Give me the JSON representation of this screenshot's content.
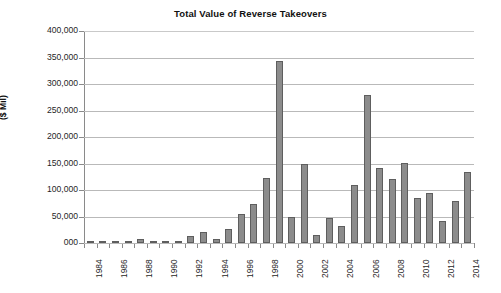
{
  "chart_data": {
    "type": "bar",
    "title": "Total Value of Reverse Takeovers",
    "xlabel": "",
    "ylabel": "($ Mil)",
    "ylim": [
      0,
      400000
    ],
    "ytick_values": [
      0,
      50000,
      100000,
      150000,
      200000,
      250000,
      300000,
      350000,
      400000
    ],
    "ytick_labels": [
      "000",
      "50,000",
      "100,000",
      "150,000",
      "200,000",
      "250,000",
      "300,000",
      "350,000",
      "400,000"
    ],
    "grid": "horizontal",
    "legend": "none",
    "bar_color": "#8c8c8c",
    "bar_border_color": "#5e5e5e",
    "categories": [
      "1984",
      "1985",
      "1986",
      "1987",
      "1988",
      "1989",
      "1990",
      "1991",
      "1992",
      "1993",
      "1994",
      "1995",
      "1996",
      "1997",
      "1998",
      "1999",
      "2000",
      "2001",
      "2002",
      "2003",
      "2004",
      "2005",
      "2006",
      "2007",
      "2008",
      "2009",
      "2010",
      "2011",
      "2012",
      "2013",
      "2014"
    ],
    "xtick_labels_shown": [
      "1984",
      "1986",
      "1988",
      "1990",
      "1992",
      "1994",
      "1996",
      "1998",
      "2000",
      "2002",
      "2004",
      "2006",
      "2008",
      "2010",
      "2012",
      "2014"
    ],
    "values": [
      300,
      400,
      1500,
      1800,
      7000,
      1500,
      1200,
      1800,
      13000,
      20000,
      7500,
      27000,
      55000,
      73000,
      122000,
      343000,
      49000,
      149000,
      15000,
      47000,
      32000,
      110000,
      279000,
      141000,
      120000,
      151000,
      84000,
      94000,
      42000,
      80000,
      134000
    ]
  },
  "chart_meta": {
    "units_note": "($ Mil)"
  }
}
